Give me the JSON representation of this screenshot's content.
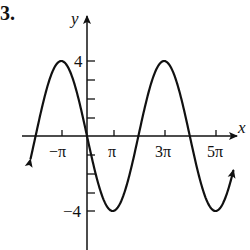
{
  "problem": {
    "number": "3."
  },
  "chart_data": {
    "type": "line",
    "title": "",
    "function_hint": "y = -4 sin(x/2)",
    "xlabel": "x",
    "ylabel": "y",
    "x_ticks": [
      {
        "value": "-pi",
        "label": "−π"
      },
      {
        "value": "pi",
        "label": "π"
      },
      {
        "value": "3pi",
        "label": "3π"
      },
      {
        "value": "5pi",
        "label": "5π"
      }
    ],
    "y_tick_labels": [
      {
        "value": 4,
        "label": "4"
      },
      {
        "value": -4,
        "label": "−4"
      }
    ],
    "y_ticks": [
      4,
      3,
      2,
      1,
      -1,
      -2,
      -3,
      -4
    ],
    "xlim_pi": [
      -2.25,
      5.5
    ],
    "ylim": [
      -5.5,
      5
    ],
    "grid": false,
    "legend": "none",
    "series": [
      {
        "name": "curve",
        "x_pi": [
          -2.2,
          -2,
          -1,
          0,
          1,
          2,
          3,
          4,
          5,
          5.7
        ],
        "y": [
          -0.63,
          0,
          4,
          0,
          -4,
          0,
          4,
          0,
          -4,
          -1.84
        ]
      }
    ],
    "key_points": {
      "maxima": [
        {
          "x": "-pi",
          "y": 4
        },
        {
          "x": "3pi",
          "y": 4
        }
      ],
      "minima": [
        {
          "x": "pi",
          "y": -4
        },
        {
          "x": "5pi",
          "y": -4
        }
      ],
      "zeros": [
        "-2pi",
        "0",
        "2pi",
        "4pi"
      ]
    }
  },
  "labels": {
    "x_axis": "x",
    "y_axis": "y",
    "xt0": "−π",
    "xt1": "π",
    "xt2": "3π",
    "xt3": "5π",
    "yt_top": "4",
    "yt_bottom": "−4"
  }
}
